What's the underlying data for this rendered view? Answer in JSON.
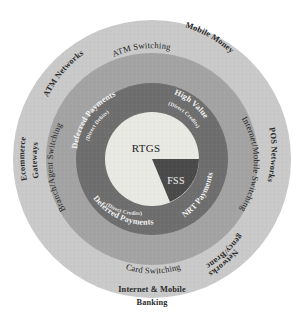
{
  "diagram": {
    "type": "concentric-ring",
    "colors": {
      "background": "#ffffff",
      "outer_ring": "#c9c9c9",
      "middle_ring": "#a3a3a3",
      "inner_ring": "#6e6e6e",
      "core_circle": "#e9e9e4",
      "core_wedge": "#4a4a4a",
      "outer_text": "#2b2b2b",
      "middle_text": "#232323",
      "inner_text": "#f2f2f2",
      "core_text": "#1c1c1c"
    },
    "core": {
      "primary_label": "RTGS",
      "wedge_label": "FSS"
    },
    "inner_ring": {
      "name": "payment-streams",
      "items": [
        {
          "label": "Deferred Payments",
          "sublabel": "(Direct Debits)",
          "position": "upper-left"
        },
        {
          "label": "High Value",
          "sublabel": "(Direct Credits)",
          "position": "upper-right"
        },
        {
          "label": "NRT Payments",
          "sublabel": "",
          "position": "lower-right"
        },
        {
          "label": "Deferred Payments",
          "sublabel": "(Direct Credits)",
          "position": "lower-left"
        }
      ]
    },
    "middle_ring": {
      "name": "switching-layer",
      "items": [
        {
          "label": "ATM Switching",
          "position": "top"
        },
        {
          "label": "Internet/Mobile Switching",
          "position": "right"
        },
        {
          "label": "Card Switching",
          "position": "bottom"
        },
        {
          "label": "Branch/Agent Switching",
          "position": "left"
        }
      ]
    },
    "outer_ring": {
      "name": "channels-layer",
      "items": [
        {
          "label": "ATM Networks",
          "line2": "",
          "position": "upper-left"
        },
        {
          "label": "Mobile Money",
          "line2": "",
          "position": "top-right"
        },
        {
          "label": "POS Networks",
          "line2": "",
          "position": "right"
        },
        {
          "label": "Agency/Branch",
          "line2": "Networks",
          "position": "lower-right"
        },
        {
          "label": "Internet & Mobile",
          "line2": "Banking",
          "position": "bottom"
        },
        {
          "label": "Ecommerce",
          "line2": "Gateways",
          "position": "left"
        }
      ]
    }
  }
}
